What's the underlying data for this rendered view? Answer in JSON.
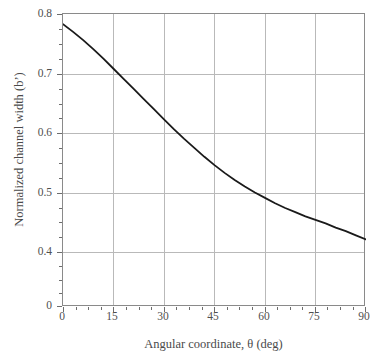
{
  "chart_data": {
    "type": "line",
    "title": "",
    "xlabel": "Angular coordinate, θ (deg)",
    "ylabel": "Normalized channel width (bʼ)",
    "xlim": [
      0,
      90
    ],
    "ylim": [
      0,
      0.8
    ],
    "grid": true,
    "legend": false,
    "xticks": [
      0,
      15,
      30,
      45,
      60,
      75,
      90
    ],
    "xtick_labels": [
      "0",
      "15",
      "30",
      "45",
      "60",
      "75",
      "90"
    ],
    "yticks": [
      0.8,
      0.7,
      0.6,
      0.5,
      0.4,
      0.0
    ],
    "ytick_labels": [
      "0.8",
      "0.7",
      "0.6",
      "0.5",
      "0.4",
      "0"
    ],
    "x_minor_interval": 3.75,
    "y_minor_interval": 0.025,
    "series": [
      {
        "name": "Normalized channel width",
        "color": "#1a1a1a",
        "x": [
          0,
          3,
          6,
          9,
          12,
          15,
          18,
          21,
          24,
          27,
          30,
          33,
          36,
          39,
          42,
          45,
          48,
          51,
          54,
          57,
          60,
          63,
          66,
          69,
          72,
          75,
          78,
          81,
          84,
          87,
          90
        ],
        "values": [
          0.783,
          0.77,
          0.756,
          0.741,
          0.725,
          0.708,
          0.691,
          0.674,
          0.657,
          0.64,
          0.623,
          0.606,
          0.59,
          0.575,
          0.56,
          0.546,
          0.533,
          0.521,
          0.51,
          0.5,
          0.491,
          0.482,
          0.474,
          0.467,
          0.46,
          0.454,
          0.448,
          0.441,
          0.435,
          0.428,
          0.421
        ]
      }
    ],
    "annotations": [
      {
        "text": "curve crosses 0.70 near θ = 15°"
      },
      {
        "text": "curve crosses 0.60 near θ = 33°"
      },
      {
        "text": "curve crosses 0.50 near θ = 57°"
      }
    ]
  },
  "axes": {
    "x_title": "Angular coordinate, θ (deg)",
    "y_title": "Normalized channel width (bʼ)",
    "x_labels": [
      "0",
      "15",
      "30",
      "45",
      "60",
      "75",
      "90"
    ],
    "y_labels": [
      "0.8",
      "0.7",
      "0.6",
      "0.5",
      "0.4",
      "0"
    ]
  },
  "style": {
    "frame_color": "#8a8a8a",
    "grid_color": "#b9b9b9",
    "curve_color": "#1a1a1a",
    "text_color": "#4a4a4a",
    "background": "#ffffff"
  }
}
